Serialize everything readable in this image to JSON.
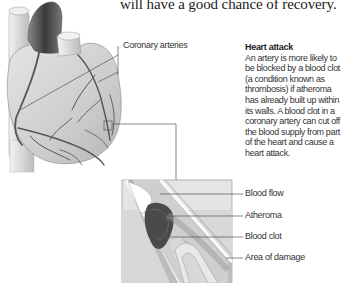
{
  "page": {
    "top_text": "will have a good chance of recovery."
  },
  "heart_diagram": {
    "label": "Coronary arteries"
  },
  "sidebar": {
    "title": "Heart attack",
    "body": "An artery is more likely to be blocked by a blood clot (a condition known as thrombosis) if atheroma has already built up within its walls. A blood clot in a coronary artery can cut off the blood supply from part of the heart and cause a heart attack."
  },
  "inset_diagram": {
    "labels": [
      "Blood flow",
      "Atheroma",
      "Blood clot",
      "Area of damage"
    ]
  },
  "colors": {
    "text": "#333333",
    "leader_line": "#555555",
    "heart_fill": "#cfcfcf",
    "artery_dark": "#555555",
    "clot": "#4a4a4a"
  }
}
